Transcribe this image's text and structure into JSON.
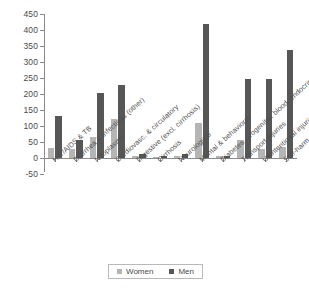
{
  "chart_data": {
    "type": "bar",
    "title": "",
    "subtitle": "",
    "xlabel": "",
    "ylabel": "",
    "ylim": [
      -50,
      450
    ],
    "ytick_step": 50,
    "grid": false,
    "legend_position": "bottom",
    "categories": [
      "HIV/AIDS & TB",
      "Diarrhea & infections (other)",
      "Neoplasms",
      "Cardiovasc. & circulatory",
      "Digestive (excl. cirrhosis)",
      "Cirrhosis",
      "Neurological",
      "Mental & behavioral",
      "Diabetes, urogenital, blood, endocrine",
      "Transport injuries",
      "Unintentional injuries excl. transport",
      "Self-harm & violence"
    ],
    "ytick_labels": [
      "450",
      "400",
      "350",
      "300",
      "250",
      "200",
      "150",
      "100",
      "50",
      "0",
      "-50"
    ],
    "ytick_values": [
      450,
      400,
      350,
      300,
      250,
      200,
      150,
      100,
      50,
      0,
      -50
    ],
    "series": [
      {
        "name": "Women",
        "color": "#b5b5b5",
        "values": [
          30,
          27,
          67,
          123,
          6,
          4,
          6,
          108,
          6,
          57,
          27,
          33
        ]
      },
      {
        "name": "Men",
        "color": "#575757",
        "values": [
          132,
          57,
          202,
          229,
          13,
          6,
          13,
          418,
          5,
          247,
          248,
          337
        ]
      }
    ]
  },
  "legend": {
    "items": [
      {
        "label": "Women",
        "color": "#b5b5b5"
      },
      {
        "label": "Men",
        "color": "#575757"
      }
    ]
  },
  "colors": {
    "women": "#b5b5b5",
    "men": "#575757",
    "axis": "#8b8b8b",
    "text": "#4a4a4a",
    "background": "#ffffff"
  }
}
